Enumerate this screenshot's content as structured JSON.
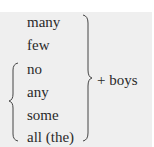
{
  "diagram": {
    "words": [
      "many",
      "few",
      "no",
      "any",
      "some",
      "all (the)"
    ],
    "result": "+ boys",
    "left_brace_group": [
      "no",
      "any",
      "some",
      "all (the)"
    ],
    "right_brace_group": [
      "many",
      "few",
      "no",
      "any",
      "some",
      "all (the)"
    ]
  },
  "colors": {
    "background": "#efefef",
    "text": "#2a2a2a"
  }
}
